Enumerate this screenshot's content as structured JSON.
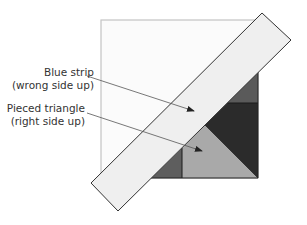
{
  "figure": {
    "labels": [
      {
        "id": "blue-strip",
        "line1": "Blue strip",
        "line2": "(wrong side up)"
      },
      {
        "id": "pieced-triangle",
        "line1": "Pieced triangle",
        "line2": "(right side up)"
      }
    ],
    "colors": {
      "background_square": "#fbfbfb",
      "square_border": "#bbbbbb",
      "strip_fill": "#efefef",
      "strip_border": "#333333",
      "dark_patch": "#2a2a2a",
      "medium_dark_patch": "#5a5a5a",
      "light_gray_triangle": "#a8a8a8",
      "arrow": "#444444"
    }
  }
}
